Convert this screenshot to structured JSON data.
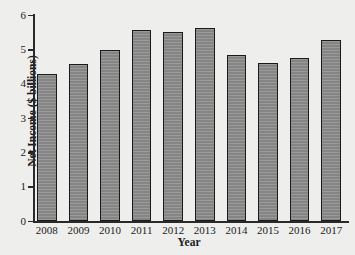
{
  "chart_data": {
    "type": "bar",
    "title": "",
    "xlabel": "Year",
    "ylabel": "Net Income ($ billions)",
    "categories": [
      "2008",
      "2009",
      "2010",
      "2011",
      "2012",
      "2013",
      "2014",
      "2015",
      "2016",
      "2017"
    ],
    "values": [
      4.31,
      4.58,
      4.99,
      5.57,
      5.53,
      5.63,
      4.84,
      4.61,
      4.75,
      5.28
    ],
    "ylim": [
      0,
      6
    ],
    "ytick_labels": [
      "0",
      "1",
      "2",
      "3",
      "4",
      "5",
      "6"
    ],
    "ytick_values": [
      0,
      1,
      2,
      3,
      4,
      5,
      6
    ],
    "grid": false,
    "legend": false,
    "bar_color": "#8b8b8b",
    "bar_edge_color": "#1a1a1a",
    "background_color": "#eeeeec",
    "axis_color": "#2a2a2a"
  }
}
